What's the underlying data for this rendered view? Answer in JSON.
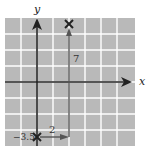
{
  "diagram": {
    "type": "vector-displacement-grid",
    "axes": {
      "x_label": "x",
      "y_label": "y"
    },
    "grid": {
      "columns": 8,
      "rows": 8,
      "fill_color": "#b9b9b9",
      "line_color": "#ffffff"
    },
    "labels": {
      "horizontal_component": "2",
      "vertical_component": "7",
      "start_value": "−3.5"
    },
    "points": [
      {
        "name": "start",
        "marker": "x-mark"
      },
      {
        "name": "end",
        "marker": "x-mark"
      }
    ],
    "colors": {
      "axis": "#222222",
      "vector": "#555555",
      "text": "#333333"
    }
  }
}
